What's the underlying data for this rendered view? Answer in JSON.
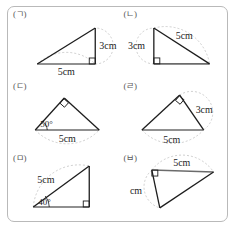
{
  "figure": {
    "name": "triangle-construction-worksheet",
    "border_color": "#b9b9b9",
    "stroke_color": "#1d1d1d",
    "guide_color": "#bbbbbb",
    "base_color": "#6b6b6b"
  },
  "panels": [
    {
      "id": "panel-a",
      "label": "(ㄱ)",
      "description": "right triangle, right angle at bottom right",
      "labels": [
        {
          "name": "side-base",
          "text": "5cm"
        },
        {
          "name": "side-vertical",
          "text": "3cm"
        }
      ],
      "right_angle": "bottom-right"
    },
    {
      "id": "panel-b",
      "label": "(ㄴ)",
      "description": "right triangle, right angle at bottom left",
      "labels": [
        {
          "name": "side-vertical",
          "text": "3cm"
        },
        {
          "name": "side-hypotenuse",
          "text": "5cm"
        }
      ],
      "right_angle": "bottom-left"
    },
    {
      "id": "panel-c",
      "label": "(ㄷ)",
      "description": "triangle with 50 degree base angle and right angle at apex",
      "labels": [
        {
          "name": "angle-base-left",
          "text": "50°"
        },
        {
          "name": "side-base",
          "text": "5cm"
        }
      ],
      "right_angle": "apex"
    },
    {
      "id": "panel-d",
      "label": "(ㄹ)",
      "description": "triangle with right angle at apex, 3cm right side, 5cm base",
      "labels": [
        {
          "name": "side-right",
          "text": "3cm"
        },
        {
          "name": "side-base",
          "text": "5cm"
        }
      ],
      "right_angle": "apex"
    },
    {
      "id": "panel-e",
      "label": "(ㅁ)",
      "description": "right triangle, 40 degree angle at bottom left, 5cm hypotenuse",
      "labels": [
        {
          "name": "side-hypotenuse",
          "text": "5cm"
        },
        {
          "name": "angle-base-left",
          "text": "40°"
        }
      ],
      "right_angle": "bottom-right"
    },
    {
      "id": "panel-f",
      "label": "(ㅂ)",
      "description": "right triangle, right angle at top left, 5cm top side",
      "labels": [
        {
          "name": "side-top",
          "text": "5cm"
        },
        {
          "name": "side-vertical",
          "text": "cm"
        }
      ],
      "right_angle": "top-left"
    }
  ]
}
